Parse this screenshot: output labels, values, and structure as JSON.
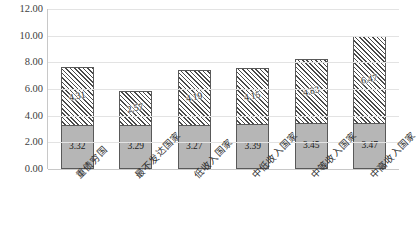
{
  "chart_data": {
    "type": "bar",
    "subtype": "stacked-bar",
    "title": "",
    "xlabel": "",
    "ylabel": "",
    "ylim": [
      0,
      12
    ],
    "ytick_step": 2,
    "ytick_labels": [
      "0.00",
      "2.00",
      "4.00",
      "6.00",
      "8.00",
      "10.00",
      "12.00"
    ],
    "ytick_values": [
      0,
      2,
      4,
      6,
      8,
      10,
      12
    ],
    "grid": true,
    "grid_axis": "y",
    "legend": false,
    "legend_position": "none",
    "xtick_rotation": -45,
    "categories": [
      "重债穷国",
      "最不发达国家",
      "低收入国家",
      "中低收入国家",
      "中等收入国家",
      "中高收入国家"
    ],
    "series": [
      {
        "name": "下段",
        "style": "solid-gray",
        "color": "#b6b6b6",
        "values": [
          3.32,
          3.29,
          3.27,
          3.39,
          3.45,
          3.47
        ],
        "labels": [
          "3.32",
          "3.29",
          "3.27",
          "3.39",
          "3.45",
          "3.47"
        ]
      },
      {
        "name": "上段",
        "style": "diagonal-hatch",
        "color": "#ffffff",
        "values": [
          4.31,
          2.57,
          4.19,
          4.15,
          4.83,
          6.47
        ],
        "labels": [
          "4.31",
          "2.57",
          "4.19",
          "4.15",
          "4.83",
          "6.47"
        ]
      }
    ],
    "totals": [
      7.63,
      5.86,
      7.46,
      7.54,
      8.28,
      9.94
    ],
    "colors": {
      "gridline": "#e3e3e3",
      "axis": "#c8c8c8",
      "bar_fill_bottom": "#b6b6b6",
      "bar_fill_top": "#ffffff",
      "bar_border": "#595959",
      "hatch": "#4a4a4a",
      "text": "#404040",
      "background": "#ffffff"
    }
  }
}
